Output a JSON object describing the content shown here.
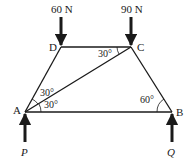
{
  "diagram": {
    "type": "truss-free-body",
    "points": {
      "A": {
        "label": "A",
        "x": 25,
        "y": 112
      },
      "B": {
        "label": "B",
        "x": 172,
        "y": 112
      },
      "C": {
        "label": "C",
        "x": 131,
        "y": 47
      },
      "D": {
        "label": "D",
        "x": 61,
        "y": 47
      }
    },
    "members": [
      "AB",
      "BC",
      "CD",
      "DA",
      "AC"
    ],
    "loads": [
      {
        "id": "load-D",
        "label": "60 N",
        "at": "D",
        "direction": "down"
      },
      {
        "id": "load-C",
        "label": "90 N",
        "at": "C",
        "direction": "down"
      }
    ],
    "reactions": [
      {
        "id": "reaction-A",
        "label": "P",
        "at": "A",
        "direction": "up"
      },
      {
        "id": "reaction-B",
        "label": "Q",
        "at": "B",
        "direction": "up"
      }
    ],
    "angles": [
      {
        "id": "angle-DCA",
        "label": "30°",
        "at": "C"
      },
      {
        "id": "angle-DAC",
        "label": "30°",
        "at": "A",
        "position": "upper"
      },
      {
        "id": "angle-CAB",
        "label": "30°",
        "at": "A",
        "position": "lower"
      },
      {
        "id": "angle-ABC",
        "label": "60°",
        "at": "B"
      }
    ],
    "colors": {
      "stroke": "#1a1a1a",
      "background": "#ffffff"
    }
  }
}
